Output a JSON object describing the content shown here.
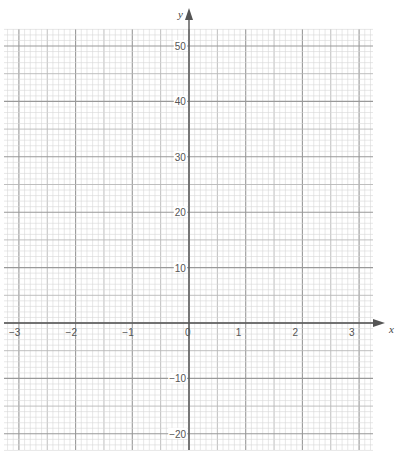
{
  "chart_data": {
    "type": "line",
    "title": "",
    "xlabel": "x",
    "ylabel": "y",
    "xlim": [
      -3.26,
      3.25
    ],
    "ylim": [
      -23,
      53
    ],
    "x_ticks": [
      -3,
      -2,
      -1,
      0,
      1,
      2,
      3
    ],
    "x_tick_labels": [
      "−3",
      "−2",
      "−1",
      "0",
      "1",
      "2",
      "3"
    ],
    "y_ticks": [
      -20,
      -10,
      10,
      20,
      30,
      40,
      50
    ],
    "y_tick_labels": [
      "−20",
      "−10",
      "10",
      "20",
      "30",
      "40",
      "50"
    ],
    "grid": true,
    "grid_minor_x_step": 0.1,
    "grid_mid_x_step": 0.5,
    "grid_major_x_step": 1,
    "grid_minor_y_step": 1,
    "grid_mid_y_step": 5,
    "grid_major_y_step": 10,
    "series": [],
    "legend": null
  },
  "layout": {
    "origin_px": [
      189,
      323
    ],
    "x_unit_px": 56.7,
    "y_unit_px": 5.54,
    "grid_box_px": {
      "left": 4,
      "top": 29,
      "right": 373,
      "bottom": 450
    },
    "x_arrow_end_px": 385,
    "y_arrow_end_px": 8
  },
  "colors": {
    "minor_grid": "#d6d6d6",
    "mid_grid": "#b8b8b8",
    "major_grid": "#999999",
    "axis": "#555555",
    "label": "#555555"
  }
}
